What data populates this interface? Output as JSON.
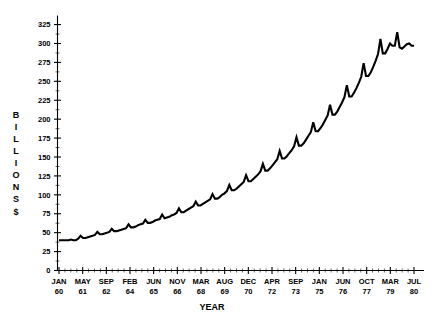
{
  "chart_data": {
    "type": "line",
    "title": "",
    "xlabel": "YEAR",
    "ylabel": "BILLIONS $",
    "ylabel_letters": [
      "B",
      "I",
      "L",
      "L",
      "I",
      "O",
      "N",
      "S",
      "$"
    ],
    "grid": false,
    "legend": "none",
    "ylim": [
      0,
      337
    ],
    "yticks": [
      0,
      25,
      50,
      75,
      100,
      125,
      150,
      175,
      200,
      225,
      250,
      275,
      300,
      325
    ],
    "ytick_labels": [
      "0",
      "25",
      "50",
      "75",
      "100",
      "125",
      "150",
      "175",
      "200",
      "225",
      "250",
      "275",
      "300",
      "325"
    ],
    "xtick_labels": [
      {
        "month": "JAN",
        "year": "60"
      },
      {
        "month": "MAY",
        "year": "61"
      },
      {
        "month": "SEP",
        "year": "62"
      },
      {
        "month": "FEB",
        "year": "64"
      },
      {
        "month": "JUN",
        "year": "65"
      },
      {
        "month": "NOV",
        "year": "66"
      },
      {
        "month": "MAR",
        "year": "68"
      },
      {
        "month": "AUG",
        "year": "69"
      },
      {
        "month": "DEC",
        "year": "70"
      },
      {
        "month": "APR",
        "year": "72"
      },
      {
        "month": "SEP",
        "year": "73"
      },
      {
        "month": "JAN",
        "year": "75"
      },
      {
        "month": "JUN",
        "year": "76"
      },
      {
        "month": "OCT",
        "year": "77"
      },
      {
        "month": "MAR",
        "year": "79"
      },
      {
        "month": "JUL",
        "year": "80"
      }
    ],
    "x_range_start": "JAN 60",
    "x_range_end": "JUL 80",
    "series": [
      {
        "name": "Money Supply",
        "color": "#000000",
        "values": [
          40,
          40,
          40,
          40,
          40,
          41,
          40,
          40,
          42,
          46,
          43,
          43,
          44,
          45,
          46,
          47,
          51,
          48,
          48,
          49,
          50,
          51,
          55,
          52,
          52,
          53,
          54,
          55,
          56,
          61,
          57,
          57,
          58,
          60,
          61,
          62,
          67,
          63,
          63,
          64,
          66,
          67,
          68,
          74,
          69,
          70,
          71,
          73,
          74,
          76,
          82,
          77,
          77,
          79,
          81,
          83,
          85,
          91,
          86,
          86,
          88,
          90,
          92,
          94,
          101,
          95,
          95,
          97,
          100,
          102,
          105,
          113,
          106,
          106,
          108,
          111,
          114,
          117,
          126,
          118,
          118,
          121,
          124,
          127,
          131,
          141,
          132,
          132,
          135,
          139,
          143,
          147,
          158,
          148,
          148,
          151,
          155,
          159,
          164,
          176,
          165,
          165,
          168,
          173,
          178,
          183,
          196,
          184,
          184,
          188,
          193,
          199,
          205,
          219,
          206,
          206,
          210,
          216,
          222,
          229,
          245,
          230,
          230,
          235,
          241,
          248,
          256,
          274,
          257,
          257,
          262,
          269,
          277,
          286,
          306,
          287,
          287,
          293,
          300,
          297,
          297,
          315,
          295,
          293,
          296,
          299,
          300,
          297,
          297
        ]
      }
    ]
  }
}
